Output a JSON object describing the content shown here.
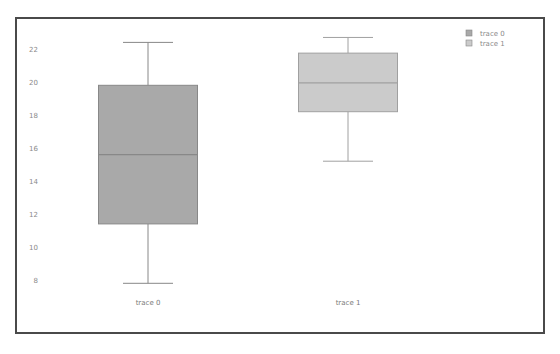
{
  "chart_data": {
    "type": "box",
    "title": "",
    "xlabel": "",
    "ylabel": "",
    "ylim": [
      7.5,
      23
    ],
    "yticks": [
      8,
      10,
      12,
      14,
      16,
      18,
      20,
      22
    ],
    "grid": false,
    "legend_position": "top-right",
    "categories": [
      "trace 0",
      "trace 1"
    ],
    "series": [
      {
        "name": "trace 0",
        "color": "#a9a9a9",
        "line_color": "#888888",
        "lowerfence": 7.8,
        "q1": 11.4,
        "median": 15.6,
        "q3": 19.8,
        "upperfence": 22.4
      },
      {
        "name": "trace 1",
        "color": "#cbcbcb",
        "line_color": "#a0a0a0",
        "lowerfence": 15.2,
        "q1": 18.2,
        "median": 19.95,
        "q3": 21.75,
        "upperfence": 22.7
      }
    ]
  },
  "legend": {
    "items": [
      {
        "label": "trace 0",
        "color": "#a9a9a9"
      },
      {
        "label": "trace 1",
        "color": "#cbcbcb"
      }
    ]
  }
}
